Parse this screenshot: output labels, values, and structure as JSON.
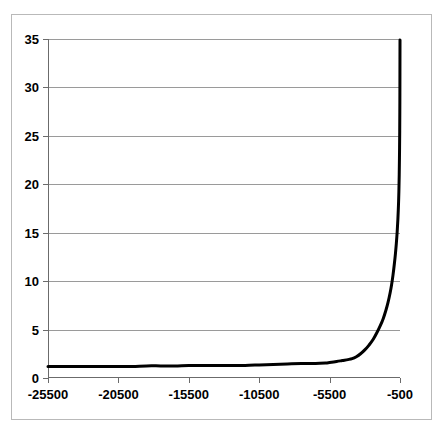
{
  "chart_data": {
    "type": "line",
    "title": "",
    "subtitle": "",
    "xlabel": "",
    "ylabel": "",
    "xlim": [
      -25500,
      -500
    ],
    "ylim": [
      0,
      35
    ],
    "grid": true,
    "legend": null,
    "legend_position": "none",
    "y_ticks": [
      35,
      30,
      25,
      20,
      15,
      10,
      5,
      0
    ],
    "y_tick_labels": [
      "35",
      "30",
      "25",
      "20",
      "15",
      "10",
      "5",
      "0"
    ],
    "x_ticks": [
      -25500,
      -20500,
      -15500,
      -10500,
      -5500,
      -500
    ],
    "x_tick_labels": [
      "-25500",
      "-20500",
      "-15500",
      "-10500",
      "-5500",
      "-500"
    ],
    "series": [
      {
        "name": "curve",
        "color": "#000000",
        "line_width": 3,
        "x": [
          -25500,
          -24500,
          -23500,
          -22500,
          -21500,
          -20500,
          -19500,
          -18500,
          -17500,
          -16500,
          -15500,
          -14500,
          -13500,
          -12500,
          -11500,
          -10500,
          -9500,
          -8500,
          -7500,
          -6500,
          -5800,
          -5500,
          -5000,
          -4600,
          -4200,
          -3900,
          -3600,
          -3300,
          -3000,
          -2700,
          -2400,
          -2100,
          -1900,
          -1700,
          -1500,
          -1350,
          -1200,
          -1100,
          -1000,
          -900,
          -820,
          -760,
          -700,
          -650,
          -610,
          -580,
          -555,
          -535,
          -520,
          -510,
          -505,
          -500
        ],
        "y": [
          1.2,
          1.2,
          1.2,
          1.2,
          1.2,
          1.2,
          1.2,
          1.25,
          1.25,
          1.25,
          1.3,
          1.3,
          1.3,
          1.3,
          1.3,
          1.35,
          1.4,
          1.45,
          1.5,
          1.5,
          1.55,
          1.6,
          1.7,
          1.8,
          1.9,
          2.0,
          2.2,
          2.5,
          2.9,
          3.4,
          4.0,
          4.8,
          5.4,
          6.1,
          7.0,
          7.8,
          8.8,
          9.6,
          10.6,
          11.8,
          12.9,
          13.9,
          15.1,
          16.4,
          17.8,
          19.2,
          21.0,
          23.2,
          25.5,
          28.5,
          31.5,
          34.9
        ]
      }
    ]
  }
}
